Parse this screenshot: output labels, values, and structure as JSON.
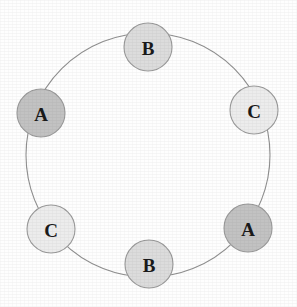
{
  "diagram": {
    "type": "cycle-graph",
    "title": "",
    "background_color": "#fefefe",
    "ring": {
      "center_x": 148,
      "center_y": 155,
      "radius": 122,
      "stroke_color": "#8f8f8f",
      "stroke_width": 1.1
    },
    "node_radius": 24,
    "node_stroke_color": "#9a9a9a",
    "label_color": "#1a1a1a",
    "legend": {
      "A_fill": "#c2c2c2",
      "B_fill": "#dcdcdc",
      "C_fill": "#ececec"
    },
    "nodes": [
      {
        "id": "node-top-b",
        "label": "B",
        "cx": 148,
        "cy": 47,
        "fill": "#dcdcdc",
        "angle_deg": 270,
        "position": "top"
      },
      {
        "id": "node-right-upper-c",
        "label": "C",
        "cx": 254,
        "cy": 110,
        "fill": "#ececec",
        "angle_deg": 330,
        "position": "upper-right"
      },
      {
        "id": "node-right-lower-a",
        "label": "A",
        "cx": 248,
        "cy": 228,
        "fill": "#c2c2c2",
        "angle_deg": 30,
        "position": "lower-right"
      },
      {
        "id": "node-bottom-b",
        "label": "B",
        "cx": 149,
        "cy": 264,
        "fill": "#dcdcdc",
        "angle_deg": 90,
        "position": "bottom"
      },
      {
        "id": "node-left-lower-c",
        "label": "C",
        "cx": 51,
        "cy": 229,
        "fill": "#ececec",
        "angle_deg": 150,
        "position": "lower-left"
      },
      {
        "id": "node-left-upper-a",
        "label": "A",
        "cx": 41,
        "cy": 113,
        "fill": "#c2c2c2",
        "angle_deg": 210,
        "position": "upper-left"
      }
    ],
    "sequence": [
      "B",
      "C",
      "A",
      "B",
      "C",
      "A"
    ]
  }
}
